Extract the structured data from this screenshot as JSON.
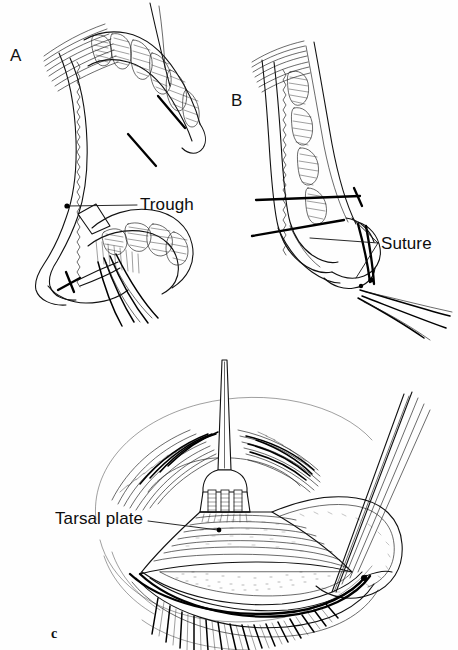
{
  "figure": {
    "kind": "medical-surgical-illustration",
    "background_color": "#fefefe",
    "ink_color": "#111111",
    "width": 458,
    "height": 650
  },
  "panels": [
    {
      "id": "A",
      "letter": "A",
      "description": "Sagittal cross-section of eyelid showing tarsal plate with meibomian glands, incision marks and a trough cut into the tarsus, with eyelashes and suture at the lid margin",
      "annotations": [
        {
          "name": "trough",
          "label": "Trough"
        }
      ]
    },
    {
      "id": "B",
      "letter": "B",
      "description": "Sagittal cross-section of eyelid after the trough is closed, sutures drawn tight across the tarsal plate, everting the lid margin",
      "annotations": [
        {
          "name": "suture",
          "label": "Suture"
        }
      ]
    },
    {
      "id": "C",
      "letter": "c",
      "description": "Frontal external view of the eye with a Desmarres retractor everting the upper lid and forceps at the lateral canthus, exposing the tarsal plate",
      "annotations": [
        {
          "name": "tarsal-plate",
          "label": "Tarsal plate"
        }
      ]
    }
  ],
  "labels": {
    "panel_a": "A",
    "panel_b": "B",
    "panel_c": "c",
    "trough": "Trough",
    "suture": "Suture",
    "tarsal_plate": "Tarsal plate"
  },
  "instruments": [
    {
      "name": "desmarres-retractor",
      "panel": "C"
    },
    {
      "name": "forceps",
      "panel": "C"
    },
    {
      "name": "suture-thread",
      "panel": "A"
    },
    {
      "name": "suture-thread",
      "panel": "B"
    }
  ]
}
